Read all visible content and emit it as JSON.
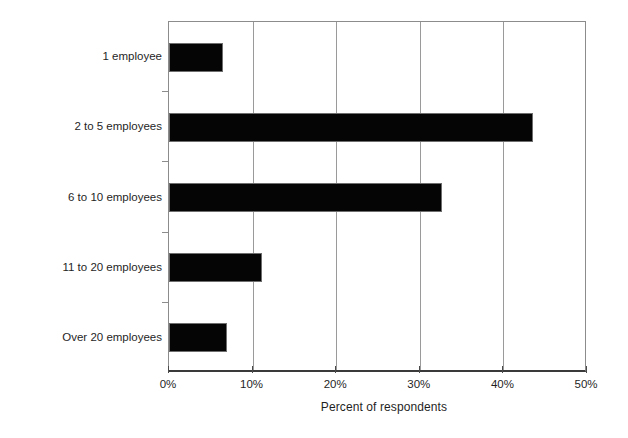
{
  "chart_data": {
    "type": "bar",
    "orientation": "horizontal",
    "title": "",
    "subtitle": "",
    "xlabel": "Percent of respondents",
    "ylabel": "",
    "categories": [
      "1 employee",
      "2 to 5 employees",
      "6 to 10 employees",
      "11 to 20 employees",
      "Over 20 employees"
    ],
    "values": [
      6.5,
      43.5,
      32.7,
      11.1,
      6.9
    ],
    "value_unit": "percent",
    "xlim": [
      0,
      50
    ],
    "xticks": [
      0,
      10,
      20,
      30,
      40,
      50
    ],
    "xtick_labels": [
      "0%",
      "10%",
      "20%",
      "30%",
      "40%",
      "50%"
    ],
    "grid": "vertical",
    "legend": "none",
    "bar_color": "#050505",
    "plot_background": "#ffffff",
    "axis_color": "#8c8c8c"
  }
}
